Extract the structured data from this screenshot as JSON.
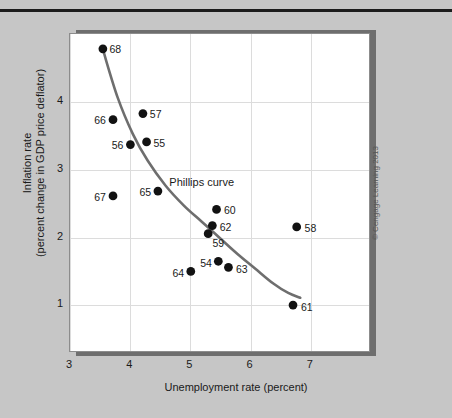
{
  "figure": {
    "copyright": "© Cengage Learning 2013",
    "curve_label": "Phillips curve"
  },
  "chart_data": {
    "type": "scatter",
    "title": "",
    "xlabel": "Unemployment rate (percent)",
    "ylabel": "Inflation rate (percent change in GDP price deflator)",
    "ylabel_lines": [
      "Inflation rate",
      "(percent change in GDP price deflator)"
    ],
    "xlim": [
      3,
      8
    ],
    "ylim": [
      0.3,
      5.0
    ],
    "xticks": [
      3,
      4,
      5,
      6,
      7
    ],
    "yticks": [
      1,
      2,
      3,
      4
    ],
    "xtick_labels": [
      "3",
      "4",
      "5",
      "6",
      "7"
    ],
    "ytick_labels": [
      "1",
      "2",
      "3",
      "4"
    ],
    "grid": true,
    "legend": "none",
    "annotations": [
      {
        "text": "Phillips curve",
        "x": 4.65,
        "y": 2.82
      }
    ],
    "marker_color": "#121212",
    "curve_color": "#6e6e6e",
    "points": [
      {
        "label": "68",
        "x": 3.55,
        "y": 4.78,
        "label_side": "right"
      },
      {
        "label": "66",
        "x": 3.72,
        "y": 3.73,
        "label_side": "left"
      },
      {
        "label": "57",
        "x": 4.22,
        "y": 3.82,
        "label_side": "right"
      },
      {
        "label": "56",
        "x": 4.01,
        "y": 3.36,
        "label_side": "left"
      },
      {
        "label": "55",
        "x": 4.28,
        "y": 3.4,
        "label_side": "right"
      },
      {
        "label": "67",
        "x": 3.72,
        "y": 2.6,
        "label_side": "left"
      },
      {
        "label": "65",
        "x": 4.47,
        "y": 2.67,
        "label_side": "left"
      },
      {
        "label": "60",
        "x": 5.45,
        "y": 2.4,
        "label_side": "right"
      },
      {
        "label": "62",
        "x": 5.38,
        "y": 2.16,
        "label_side": "right"
      },
      {
        "label": "59",
        "x": 5.31,
        "y": 2.04,
        "label_side": "below-right"
      },
      {
        "label": "58",
        "x": 6.79,
        "y": 2.14,
        "label_side": "right"
      },
      {
        "label": "54",
        "x": 5.48,
        "y": 1.63,
        "label_side": "left"
      },
      {
        "label": "63",
        "x": 5.65,
        "y": 1.54,
        "label_side": "right"
      },
      {
        "label": "64",
        "x": 5.02,
        "y": 1.48,
        "label_side": "left"
      },
      {
        "label": "61",
        "x": 6.73,
        "y": 0.98,
        "label_side": "right"
      }
    ],
    "curve": [
      {
        "x": 3.56,
        "y": 4.74
      },
      {
        "x": 3.8,
        "y": 4.05
      },
      {
        "x": 4.05,
        "y": 3.52
      },
      {
        "x": 4.3,
        "y": 3.12
      },
      {
        "x": 4.6,
        "y": 2.75
      },
      {
        "x": 4.9,
        "y": 2.46
      },
      {
        "x": 5.2,
        "y": 2.22
      },
      {
        "x": 5.5,
        "y": 1.98
      },
      {
        "x": 5.8,
        "y": 1.74
      },
      {
        "x": 6.1,
        "y": 1.52
      },
      {
        "x": 6.4,
        "y": 1.3
      },
      {
        "x": 6.65,
        "y": 1.16
      },
      {
        "x": 6.85,
        "y": 1.09
      }
    ]
  }
}
